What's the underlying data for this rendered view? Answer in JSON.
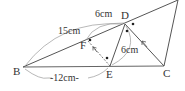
{
  "diagram": {
    "type": "geometry",
    "colors": {
      "line": "#555555",
      "arc": "#999999",
      "text": "#333333",
      "dot": "#222222"
    },
    "points": {
      "B": {
        "label": "B",
        "x": 23,
        "y": 67
      },
      "C": {
        "label": "C",
        "x": 164,
        "y": 66
      },
      "D": {
        "label": "D",
        "x": 125,
        "y": 24
      },
      "E": {
        "label": "E",
        "x": 110,
        "y": 66
      },
      "F": {
        "label": "F",
        "x": 88,
        "y": 41
      },
      "A": {
        "label": "",
        "x": 178,
        "y": 0
      }
    },
    "measurements": {
      "BD_arc": "15cm",
      "FD_arc": "6cm",
      "DE_arc": "6cm",
      "BE": "-12cm-"
    }
  }
}
